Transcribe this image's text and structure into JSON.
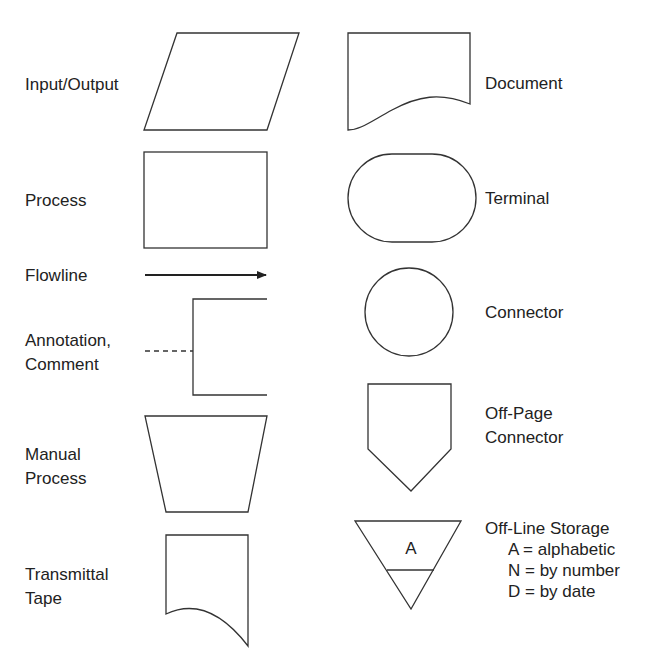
{
  "symbols": [
    {
      "name": "input-output",
      "label": "Input/Output"
    },
    {
      "name": "process",
      "label": "Process"
    },
    {
      "name": "flowline",
      "label": "Flowline"
    },
    {
      "name": "annotation",
      "label_line1": "Annotation,",
      "label_line2": "Comment"
    },
    {
      "name": "manual-process",
      "label_line1": "Manual",
      "label_line2": "Process"
    },
    {
      "name": "transmittal-tape",
      "label_line1": "Transmittal",
      "label_line2": "Tape"
    },
    {
      "name": "document",
      "label": "Document"
    },
    {
      "name": "terminal",
      "label": "Terminal"
    },
    {
      "name": "connector",
      "label": "Connector"
    },
    {
      "name": "off-page-connector",
      "label_line1": "Off-Page",
      "label_line2": "Connector"
    },
    {
      "name": "off-line-storage",
      "label": "Off-Line Storage",
      "inner_letter": "A",
      "legend": [
        "A = alphabetic",
        "N = by number",
        "D = by date"
      ]
    }
  ],
  "colors": {
    "stroke": "#333333",
    "text": "#222222",
    "background": "#ffffff"
  }
}
